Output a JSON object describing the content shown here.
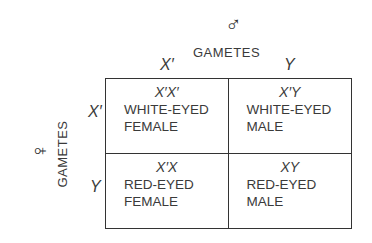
{
  "diagram": {
    "type": "punnett-square",
    "male": {
      "symbol": "♂",
      "label": "GAMETES",
      "gametes": [
        "X′",
        "Y"
      ]
    },
    "female": {
      "symbol": "♀",
      "label": "GAMETES",
      "gametes": [
        "X′",
        "Y"
      ]
    },
    "cells": [
      {
        "genotype": "X′X′",
        "phenotype": "WHITE-EYED",
        "sex": "FEMALE"
      },
      {
        "genotype": "X′Y",
        "phenotype": "WHITE-EYED",
        "sex": "MALE"
      },
      {
        "genotype": "X′X",
        "phenotype": "RED-EYED",
        "sex": "FEMALE"
      },
      {
        "genotype": "XY",
        "phenotype": "RED-EYED",
        "sex": "MALE"
      }
    ],
    "colors": {
      "ink": "#333333",
      "background": "#ffffff"
    }
  }
}
